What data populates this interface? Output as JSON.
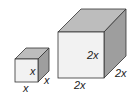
{
  "diagram": {
    "type": "cube-comparison",
    "small_cube": {
      "front_label": "x",
      "bottom_label": "x",
      "depth_label": "x"
    },
    "large_cube": {
      "front_label": "2x",
      "bottom_label": "2x",
      "depth_label": "2x"
    },
    "colors": {
      "front_face": "#f2f2f2",
      "top_face": "#bdbdbd",
      "side_face": "#9e9e9e",
      "edge": "#333333",
      "text": "#222222"
    }
  }
}
